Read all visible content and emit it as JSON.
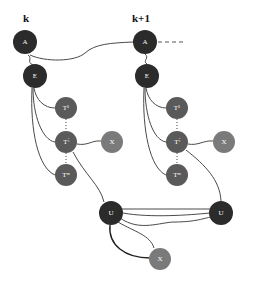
{
  "diagram": {
    "type": "graph",
    "steps": [
      {
        "label": "k"
      },
      {
        "label": "k+1"
      }
    ],
    "colors": {
      "dark_node": "#2b2b2b",
      "medium_node": "#5a5a5a",
      "light_node": "#7a7a7a",
      "edge": "#4a4a4a"
    },
    "nodes": {
      "k_A": {
        "label": "A"
      },
      "k_E": {
        "label": "E"
      },
      "k_T1": {
        "label": "T¹"
      },
      "k_Ti": {
        "label": "Tⁱ"
      },
      "k_Tm": {
        "label": "Tᵐ"
      },
      "k_X": {
        "label": "X"
      },
      "k1_A": {
        "label": "A"
      },
      "k1_E": {
        "label": "E"
      },
      "k1_T1": {
        "label": "T¹"
      },
      "k1_Ti": {
        "label": "Tⁱ"
      },
      "k1_Tm": {
        "label": "Tᵐ"
      },
      "k1_X": {
        "label": "X"
      },
      "U_left": {
        "label": "U"
      },
      "U_right": {
        "label": "U"
      },
      "X_bottom": {
        "label": "X"
      }
    },
    "edges": [
      [
        "k_A",
        "k1_A"
      ],
      [
        "k1_A",
        "continuation (dashed)"
      ],
      [
        "k_A",
        "k_E"
      ],
      [
        "k_E",
        "k_T1"
      ],
      [
        "k_E",
        "k_Ti"
      ],
      [
        "k_E",
        "k_Tm"
      ],
      [
        "k_Ti",
        "k_X"
      ],
      [
        "k_Ti",
        "U_left"
      ],
      [
        "k1_A",
        "k1_E"
      ],
      [
        "k1_E",
        "k1_T1"
      ],
      [
        "k1_E",
        "k1_Ti"
      ],
      [
        "k1_E",
        "k1_Tm"
      ],
      [
        "k1_Ti",
        "k1_X"
      ],
      [
        "k1_Ti",
        "U_right"
      ],
      [
        "U_left",
        "U_right"
      ],
      [
        "U_left",
        "X_bottom"
      ]
    ]
  }
}
